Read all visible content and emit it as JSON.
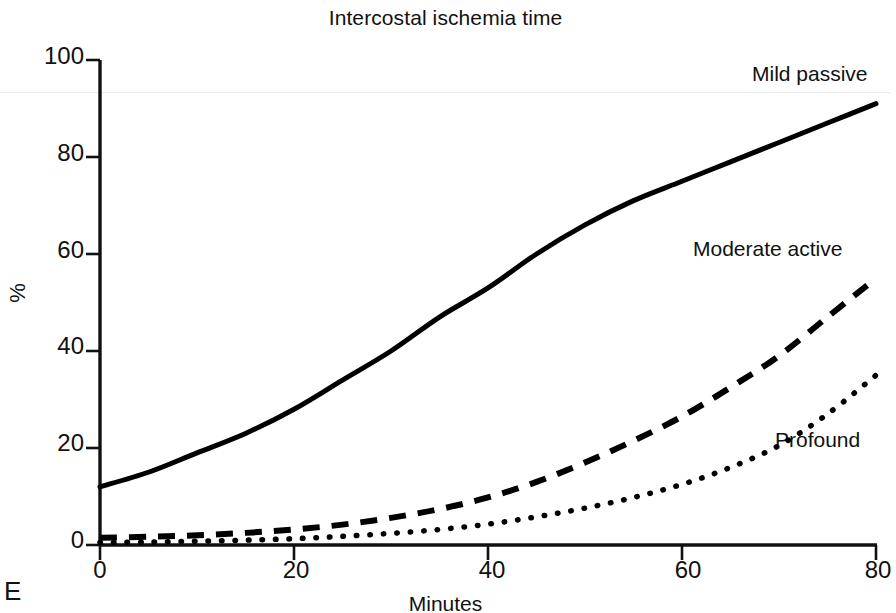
{
  "figure": {
    "panel_letter": "E",
    "title": "Intercostal ischemia time"
  },
  "chart_data": {
    "type": "line",
    "title": "Intercostal ischemia time",
    "xlabel": "Minutes",
    "ylabel": "%",
    "xlim": [
      0,
      80
    ],
    "ylim": [
      0,
      100
    ],
    "xticks": [
      0,
      20,
      40,
      60,
      80
    ],
    "yticks": [
      0,
      20,
      40,
      60,
      80,
      100
    ],
    "grid": false,
    "legend_position": "inline-end-of-curve",
    "x": [
      0,
      5,
      10,
      15,
      20,
      25,
      30,
      35,
      40,
      45,
      50,
      55,
      60,
      65,
      70,
      75,
      80
    ],
    "series": [
      {
        "name": "Mild passive",
        "style": "solid",
        "color": "#000000",
        "values": [
          12,
          15,
          19,
          23,
          28,
          34,
          40,
          47,
          53,
          60,
          66,
          71,
          75,
          79,
          83,
          87,
          91
        ]
      },
      {
        "name": "Moderate active",
        "style": "dashed",
        "color": "#000000",
        "values": [
          1.5,
          1.7,
          2.0,
          2.5,
          3.2,
          4.2,
          5.6,
          7.4,
          9.8,
          13.0,
          17.0,
          21.5,
          26.5,
          32.5,
          39.0,
          47.0,
          55.0
        ]
      },
      {
        "name": "Profound",
        "style": "dotted",
        "color": "#000000",
        "values": [
          0.5,
          0.6,
          0.8,
          1.0,
          1.3,
          1.8,
          2.4,
          3.2,
          4.3,
          5.8,
          7.6,
          9.8,
          12.5,
          16.0,
          20.5,
          27.0,
          35.0
        ]
      }
    ],
    "annotations": [
      {
        "text": "Mild passive",
        "x": 69,
        "y": 94
      },
      {
        "text": "Moderate active",
        "x": 64,
        "y": 61
      },
      {
        "text": "Profound",
        "x": 69,
        "y": 26
      }
    ]
  },
  "axis": {
    "y_tick_labels": [
      "100",
      "80",
      "60",
      "40",
      "20",
      "0"
    ],
    "x_tick_labels": [
      "0",
      "20",
      "40",
      "60",
      "80"
    ]
  }
}
